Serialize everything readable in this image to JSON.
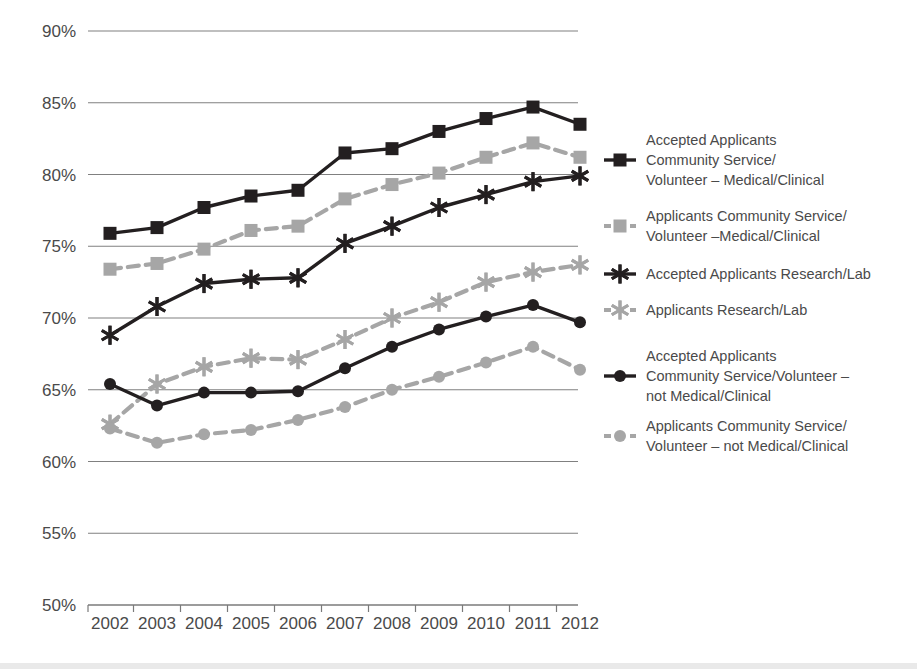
{
  "chart_data": {
    "type": "line",
    "title": "",
    "xlabel": "",
    "ylabel": "",
    "x": [
      2002,
      2003,
      2004,
      2005,
      2006,
      2007,
      2008,
      2009,
      2010,
      2011,
      2012
    ],
    "categories": [
      "2002",
      "2003",
      "2004",
      "2005",
      "2006",
      "2007",
      "2008",
      "2009",
      "2010",
      "2011",
      "2012"
    ],
    "ylim": [
      50,
      90
    ],
    "yticks": [
      50,
      55,
      60,
      65,
      70,
      75,
      80,
      85,
      90
    ],
    "ytick_labels": [
      "50%",
      "55%",
      "60%",
      "65%",
      "70%",
      "75%",
      "80%",
      "85%",
      "90%"
    ],
    "grid": true,
    "legend_position": "right",
    "series": [
      {
        "name": "Accepted Applicants Community Service/Volunteer – Medical/Clinical",
        "legend_lines": [
          "Accepted Applicants",
          "Community Service/",
          "Volunteer – Medical/Clinical"
        ],
        "marker": "square",
        "dash": "solid",
        "color": "#231f20",
        "values": [
          75.9,
          76.3,
          77.7,
          78.5,
          78.9,
          81.5,
          81.8,
          83.0,
          83.9,
          84.7,
          83.5
        ]
      },
      {
        "name": "Applicants Community Service/Volunteer –Medical/Clinical",
        "legend_lines": [
          "Applicants Community Service/",
          "Volunteer –Medical/Clinical"
        ],
        "marker": "square",
        "dash": "dashed",
        "color": "#a6a6a6",
        "values": [
          73.4,
          73.8,
          74.8,
          76.1,
          76.4,
          78.3,
          79.3,
          80.1,
          81.2,
          82.2,
          81.2
        ]
      },
      {
        "name": "Accepted Applicants Research/Lab",
        "legend_lines": [
          "Accepted Applicants Research/Lab"
        ],
        "marker": "asterisk",
        "dash": "solid",
        "color": "#231f20",
        "values": [
          68.8,
          70.8,
          72.4,
          72.7,
          72.8,
          75.2,
          76.4,
          77.7,
          78.6,
          79.5,
          79.9
        ]
      },
      {
        "name": "Applicants Research/Lab",
        "legend_lines": [
          "Applicants Research/Lab"
        ],
        "marker": "asterisk",
        "dash": "dashed",
        "color": "#a6a6a6",
        "values": [
          62.6,
          65.4,
          66.6,
          67.2,
          67.1,
          68.5,
          70.0,
          71.1,
          72.5,
          73.2,
          73.7
        ]
      },
      {
        "name": "Accepted Applicants Community Service/Volunteer – not Medical/Clinical",
        "legend_lines": [
          "Accepted Applicants",
          "Community Service/Volunteer –",
          "not Medical/Clinical"
        ],
        "marker": "circle",
        "dash": "solid",
        "color": "#231f20",
        "values": [
          65.4,
          63.9,
          64.8,
          64.8,
          64.9,
          66.5,
          68.0,
          69.2,
          70.1,
          70.9,
          69.7
        ]
      },
      {
        "name": "Applicants Community Service/Volunteer – not Medical/Clinical",
        "legend_lines": [
          "Applicants Community Service/",
          "Volunteer – not Medical/Clinical"
        ],
        "marker": "circle",
        "dash": "dashed",
        "color": "#a6a6a6",
        "values": [
          62.3,
          61.3,
          61.9,
          62.2,
          62.9,
          63.8,
          65.0,
          65.9,
          66.9,
          68.0,
          66.4
        ]
      }
    ],
    "colors": {
      "accepted": "#231f20",
      "applicants": "#a6a6a6",
      "grid": "#808080",
      "axis": "#7a7a7a",
      "text": "#4a4a4a"
    }
  }
}
